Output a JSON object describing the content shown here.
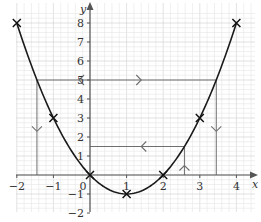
{
  "chart_data": {
    "type": "line",
    "title": "",
    "xlabel": "x",
    "ylabel": "y",
    "xlim": [
      -2,
      4
    ],
    "ylim": [
      -2,
      8.5
    ],
    "grid": true,
    "x_ticks": [
      "−2",
      "−1",
      "0",
      "1",
      "2",
      "3",
      "4"
    ],
    "y_ticks": [
      "−2",
      "−1",
      "1",
      "2",
      "3",
      "4",
      "5",
      "6",
      "7",
      "8"
    ],
    "series": [
      {
        "name": "y = x² − 2x",
        "function": "x^2 - 2x",
        "color": "#1a1a1a",
        "marked_points": [
          {
            "x": -2,
            "y": 8
          },
          {
            "x": -1,
            "y": 3
          },
          {
            "x": 0,
            "y": 0
          },
          {
            "x": 1,
            "y": -1
          },
          {
            "x": 2,
            "y": 0
          },
          {
            "x": 3,
            "y": 3
          },
          {
            "x": 4,
            "y": 8
          }
        ]
      }
    ],
    "annotations": [
      {
        "type": "horizontal_line",
        "y": 5,
        "x_from": -1.45,
        "x_to": 3.45,
        "arrows": [
          {
            "x": -0.3,
            "direction": "left"
          },
          {
            "x": 1.4,
            "direction": "right"
          }
        ],
        "color": "#666666"
      },
      {
        "type": "vertical_line",
        "x": -1.45,
        "y_from": 5,
        "y_to": 0,
        "arrow": {
          "y": 2.3,
          "direction": "down"
        },
        "color": "#777777"
      },
      {
        "type": "vertical_line",
        "x": 3.45,
        "y_from": 5,
        "y_to": 0,
        "arrow": {
          "y": 2.3,
          "direction": "down"
        },
        "color": "#777777"
      },
      {
        "type": "horizontal_line",
        "y": 1.5,
        "x_from": 0,
        "x_to": 2.58,
        "arrows": [
          {
            "x": 1.4,
            "direction": "left"
          }
        ],
        "color": "#666666"
      },
      {
        "type": "vertical_line",
        "x": 2.58,
        "y_from": 0,
        "y_to": 1.5,
        "arrow": {
          "y": 0.5,
          "direction": "up"
        },
        "color": "#777777"
      }
    ]
  },
  "colors": {
    "grid_minor": "#e6e6e6",
    "grid_major": "#cfcfcf",
    "axis": "#555555",
    "curve": "#1a1a1a",
    "guide": "#6f6f6f"
  }
}
